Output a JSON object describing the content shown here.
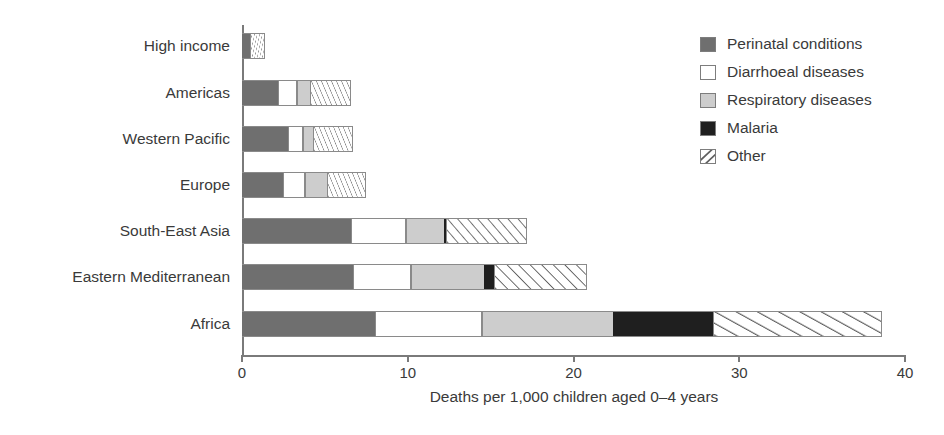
{
  "figure": {
    "top_fragment": "",
    "axis_title": "Deaths per 1,000 children aged 0–4 years"
  },
  "legend": {
    "items": [
      {
        "label": "Perinatal conditions",
        "swatch": "dark-gray-fill",
        "color": "#6f6f6f"
      },
      {
        "label": "Diarrhoeal diseases",
        "swatch": "white-fill",
        "color": "#ffffff"
      },
      {
        "label": "Respiratory diseases",
        "swatch": "light-gray-fill",
        "color": "#cdcdcd"
      },
      {
        "label": "Malaria",
        "swatch": "black-fill",
        "color": "#1f1f1f"
      },
      {
        "label": "Other",
        "swatch": "diagonal-hatch-fill",
        "color": "#ffffff"
      }
    ]
  },
  "chart_data": {
    "type": "bar",
    "orientation": "horizontal",
    "stacked": true,
    "title": "",
    "xlabel": "Deaths per 1,000 children aged 0–4 years",
    "ylabel": "",
    "xlim": [
      0,
      40
    ],
    "xticks": [
      0,
      10,
      20,
      30,
      40
    ],
    "xticklabels": [
      "0",
      "10",
      "20",
      "30",
      "40"
    ],
    "grid": false,
    "legend_position": "top-right",
    "categories": [
      "High income",
      "Americas",
      "Western Pacific",
      "Europe",
      "South-East Asia",
      "Eastern Mediterranean",
      "Africa"
    ],
    "series": [
      {
        "name": "Perinatal conditions",
        "color": "#6f6f6f",
        "values": [
          0.5,
          2.2,
          2.8,
          2.5,
          6.6,
          6.7,
          8.0
        ]
      },
      {
        "name": "Diarrhoeal diseases",
        "color": "#ffffff",
        "values": [
          0.0,
          1.1,
          0.9,
          1.3,
          3.3,
          3.5,
          6.5
        ]
      },
      {
        "name": "Respiratory diseases",
        "color": "#cdcdcd",
        "values": [
          0.0,
          0.8,
          0.6,
          1.3,
          2.3,
          4.4,
          7.9
        ]
      },
      {
        "name": "Malaria",
        "color": "#1f1f1f",
        "values": [
          0.0,
          0.0,
          0.0,
          0.0,
          0.1,
          0.6,
          6.0
        ]
      },
      {
        "name": "Other",
        "color": "#ffffff",
        "values": [
          0.9,
          2.5,
          2.4,
          2.4,
          4.9,
          5.6,
          10.2
        ]
      }
    ],
    "totals": [
      1.4,
      6.6,
      6.7,
      7.5,
      17.2,
      20.8,
      38.6
    ]
  }
}
